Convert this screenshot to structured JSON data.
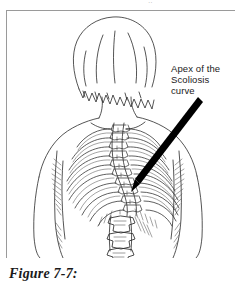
{
  "page": {
    "width": 235,
    "height": 287,
    "background_color": "#ffffff",
    "ink_color": "#1a1a1a",
    "rule_color": "#9a9a9a",
    "top_text_remnant": "··"
  },
  "illustration": {
    "name": "scoliosis-back-view-line-drawing",
    "description": "Black-and-white line drawing of a woman seen from behind, with a bob hairstyle, showing the skeletal spine, rib cage and lumbar vertebrae curving laterally (scoliosis).",
    "style": "pen-and-ink line art",
    "subject_parts": [
      "head-with-bob-hair",
      "neck",
      "left-shoulder",
      "right-shoulder",
      "left-arm",
      "right-arm",
      "torso-outline",
      "thoracic-rib-cage",
      "thoracic-spine",
      "lumbar-spine",
      "shoulder-blades"
    ]
  },
  "callout": {
    "lines": [
      "Apex of the",
      "Scoliosis",
      "curve"
    ],
    "line1": "Apex of the",
    "line2": "Scoliosis",
    "line3": "curve",
    "arrow": {
      "name": "callout-arrow",
      "from_x": 197,
      "from_y": 96,
      "to_x": 137,
      "to_y": 180,
      "color": "#000000",
      "style": "tapered-solid"
    }
  },
  "caption": {
    "text": "Figure 7-7:"
  }
}
